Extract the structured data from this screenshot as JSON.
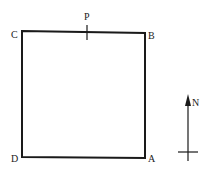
{
  "diagram": {
    "shape": "square",
    "corners": {
      "A": {
        "label": "A",
        "position": "bottom-right"
      },
      "B": {
        "label": "B",
        "position": "top-right"
      },
      "C": {
        "label": "C",
        "position": "top-left"
      },
      "D": {
        "label": "D",
        "position": "bottom-left"
      }
    },
    "point_p": {
      "label": "P",
      "position": "on side CB, marked with tick"
    },
    "north_arrow": {
      "label": "N",
      "direction": "up"
    },
    "colors": {
      "stroke": "#1a1a1a",
      "background": "#ffffff"
    }
  }
}
